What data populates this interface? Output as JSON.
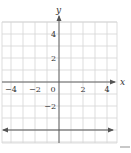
{
  "chart_data": {
    "type": "line",
    "title": "",
    "xlabel": "x",
    "ylabel": "y",
    "xlim": [
      -5,
      5
    ],
    "ylim": [
      -5,
      5
    ],
    "grid": true,
    "grid_step": 1,
    "x_ticks": [
      -4,
      -2,
      0,
      2,
      4
    ],
    "x_tick_labels": [
      "−4",
      "−2",
      "0",
      "2",
      "4"
    ],
    "y_ticks": [
      4,
      2,
      -2
    ],
    "y_tick_labels": [
      "4",
      "2",
      "−2"
    ],
    "series": [
      {
        "name": "y = -4",
        "equation": "y = -4",
        "x": [
          -5,
          5
        ],
        "y": [
          -4,
          -4
        ],
        "arrows_both_ends": true,
        "color": "#555555"
      }
    ],
    "colors": {
      "grid": "#d4d4d4",
      "axis": "#555555",
      "text": "#333333"
    }
  }
}
